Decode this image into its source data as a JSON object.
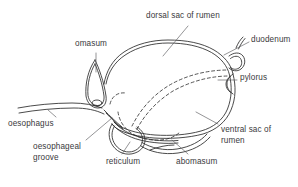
{
  "figure": {
    "type": "anatomical-line-drawing",
    "background_color": "#ffffff",
    "stroke_color": "#2b2b2b",
    "text_color": "#3a3a3c",
    "leader_line_color": "#5b5b5f"
  },
  "labels": [
    {
      "id": "omasum",
      "text": "omasum",
      "x": 75,
      "y": 41,
      "lines": [
        "omasum"
      ]
    },
    {
      "id": "dorsal-sac-of-rumen",
      "text": "dorsal sac of rumen",
      "x": 146,
      "y": 12,
      "lines": [
        "dorsal sac of rumen"
      ]
    },
    {
      "id": "duodenum",
      "text": "duodenum",
      "x": 251,
      "y": 37,
      "lines": [
        "duodenum"
      ]
    },
    {
      "id": "pylorus",
      "text": "pylorus",
      "x": 240,
      "y": 75,
      "lines": [
        "pylorus"
      ]
    },
    {
      "id": "oesophagus",
      "text": "oesophagus",
      "x": 8,
      "y": 120,
      "lines": [
        "oesophagus"
      ]
    },
    {
      "id": "ventral-sac-of-rumen",
      "text": "ventral sac of rumen",
      "x": 221,
      "y": 126,
      "lines": [
        "ventral sac of",
        "rumen"
      ]
    },
    {
      "id": "oesophageal-groove",
      "text": "oesophageal groove",
      "x": 33,
      "y": 143,
      "lines": [
        "oesophageal",
        "groove"
      ]
    },
    {
      "id": "reticulum",
      "text": "reticulum",
      "x": 106,
      "y": 158,
      "lines": [
        "reticulum"
      ]
    },
    {
      "id": "abomasum",
      "text": "abomasum",
      "x": 176,
      "y": 158,
      "lines": [
        "abomasum"
      ]
    }
  ]
}
